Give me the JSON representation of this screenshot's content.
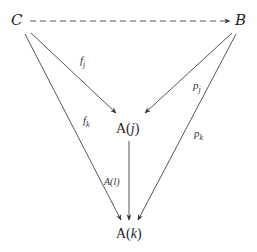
{
  "diagram": {
    "type": "commutative-diagram",
    "nodes": {
      "C": {
        "label": "C"
      },
      "B": {
        "label": "B"
      },
      "Aj": {
        "label_main": "A(",
        "label_var": "j",
        "label_close": ")"
      },
      "Ak": {
        "label_main": "A(",
        "label_var": "k",
        "label_close": ")"
      }
    },
    "edges": {
      "C_B": {
        "from": "C",
        "to": "B",
        "style": "dashed",
        "label": ""
      },
      "C_Aj": {
        "from": "C",
        "to": "A(j)",
        "label_base": "f",
        "label_sub": "j"
      },
      "B_Aj": {
        "from": "B",
        "to": "A(j)",
        "label_base": "p",
        "label_sub": "j"
      },
      "C_Ak": {
        "from": "C",
        "to": "A(k)",
        "label_base": "f",
        "label_sub": "k"
      },
      "B_Ak": {
        "from": "B",
        "to": "A(k)",
        "label_base": "p",
        "label_sub": "k"
      },
      "Aj_Ak": {
        "from": "A(j)",
        "to": "A(k)",
        "label": "A(l)"
      }
    },
    "colors": {
      "line": "#444444",
      "text": "#222222",
      "background": "#ffffff"
    }
  }
}
